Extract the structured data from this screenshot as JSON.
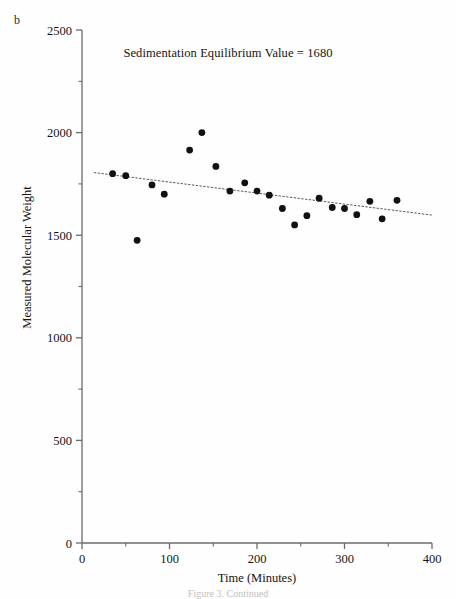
{
  "panel": {
    "label": "b"
  },
  "figure": {
    "caption": "Figure 3.  Continued"
  },
  "chart_data": {
    "type": "scatter",
    "title": "Sedimentation Equilibrium Value = 1680",
    "xlabel": "Time (Minutes)",
    "ylabel": "Measured Molecular Weight",
    "xlim": [
      0,
      400
    ],
    "ylim": [
      0,
      2500
    ],
    "xticks": [
      0,
      100,
      200,
      300,
      400
    ],
    "yticks": [
      0,
      500,
      1000,
      1500,
      2000,
      2500
    ],
    "xtick_labels": [
      "0",
      "100",
      "200",
      "300",
      "400"
    ],
    "ytick_labels": [
      "0",
      "500",
      "1000",
      "1500",
      "2000",
      "2500"
    ],
    "x_minor_ticks": [
      50,
      150,
      250,
      350
    ],
    "y_minor_ticks": [
      250,
      750,
      1250,
      1750,
      2250
    ],
    "grid": false,
    "legend": "none",
    "marker": {
      "shape": "circle",
      "color": "#111111",
      "size": 6
    },
    "sedimentation_equilibrium_value": 1680,
    "series": [
      {
        "name": "Measured Molecular Weight",
        "x": [
          35,
          50,
          63,
          80,
          94,
          123,
          137,
          153,
          169,
          186,
          200,
          214,
          229,
          243,
          257,
          271,
          286,
          300,
          314,
          329,
          343,
          360
        ],
        "y": [
          1800,
          1790,
          1475,
          1745,
          1700,
          1915,
          2000,
          1835,
          1715,
          1755,
          1715,
          1695,
          1630,
          1550,
          1595,
          1680,
          1635,
          1630,
          1600,
          1665,
          1580,
          1670
        ]
      }
    ],
    "trendline": {
      "type": "linear-fit",
      "style": "dotted",
      "color": "#5a5a5a",
      "x_start": 14,
      "x_end": 400,
      "y_start": 1805,
      "y_end": 1598
    }
  }
}
